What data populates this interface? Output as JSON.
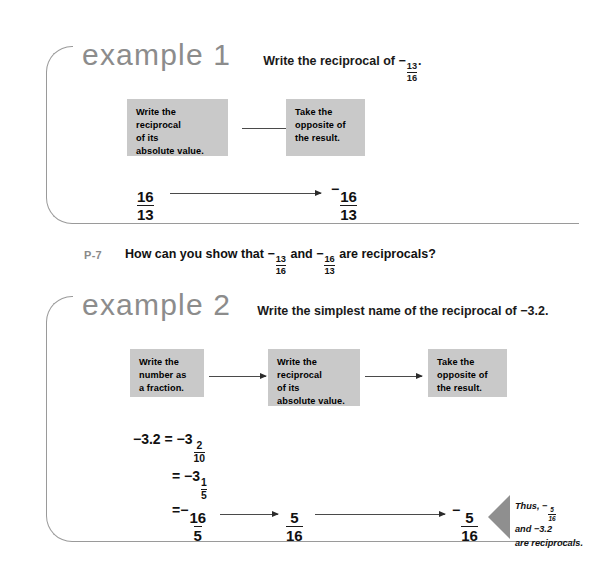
{
  "page": {
    "background": "#ffffff",
    "box_fill": "#c9c9c9",
    "frame_color": "#9a9a9a",
    "heading_color": "#8c8c8c",
    "callout_fill": "#8f8f8f"
  },
  "example1": {
    "title": "example 1",
    "prompt_prefix": "Write the reciprocal of ",
    "prompt_sign": "−",
    "prompt_fraction": {
      "numerator": "13",
      "denominator": "16"
    },
    "prompt_suffix": ".",
    "steps": [
      {
        "line1": "Write the",
        "line2": "reciprocal",
        "line3": "of its",
        "line4": "absolute value."
      },
      {
        "line1": "Take the",
        "line2": "opposite of",
        "line3": "the result."
      }
    ],
    "result_start": {
      "sign": "",
      "numerator": "16",
      "denominator": "13"
    },
    "result_end": {
      "sign": "−",
      "numerator": "16",
      "denominator": "13"
    }
  },
  "practice": {
    "label": "P-7",
    "text_part1": "How can you show that ",
    "sign1": "−",
    "fraction1": {
      "numerator": "13",
      "denominator": "16"
    },
    "text_part2": " and ",
    "sign2": "−",
    "fraction2": {
      "numerator": "16",
      "denominator": "13"
    },
    "text_part3": " are reciprocals?"
  },
  "example2": {
    "title": "example 2",
    "prompt": "Write the simplest name of the reciprocal of −3.2.",
    "steps": [
      {
        "line1": "Write the",
        "line2": "number as",
        "line3": "a fraction."
      },
      {
        "line1": "Write the",
        "line2": "reciprocal",
        "line3": "of its",
        "line4": "absolute value."
      },
      {
        "line1": "Take the",
        "line2": "opposite of",
        "line3": "the result."
      }
    ],
    "equations": {
      "line1_lhs": "−3.2",
      "line1_eq": "=",
      "line1_sign": "−3",
      "line1_fraction": {
        "numerator": "2",
        "denominator": "10"
      },
      "line2_eq": "=",
      "line2_sign": "−3",
      "line2_fraction": {
        "numerator": "1",
        "denominator": "5"
      },
      "line3_eq": "=",
      "line3_sign": "−",
      "line3_fraction": {
        "numerator": "16",
        "denominator": "5"
      }
    },
    "flow_mid": {
      "sign": "",
      "numerator": "5",
      "denominator": "16"
    },
    "flow_end": {
      "sign": "−",
      "numerator": "5",
      "denominator": "16"
    },
    "callout": {
      "line1_prefix": "Thus, ",
      "line1_sign": "−",
      "line1_fraction": {
        "numerator": "5",
        "denominator": "16"
      },
      "line2": "and −3.2",
      "line3": "are reciprocals."
    }
  }
}
